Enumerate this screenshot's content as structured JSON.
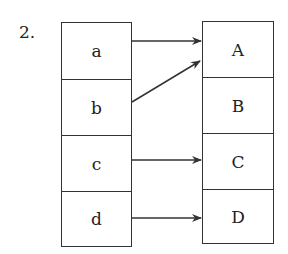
{
  "problem_number": "2.",
  "left_column": {
    "items": [
      "a",
      "b",
      "c",
      "d"
    ]
  },
  "right_column": {
    "items": [
      "A",
      "B",
      "C",
      "D"
    ]
  },
  "mappings": [
    {
      "from": "a",
      "to": "A"
    },
    {
      "from": "b",
      "to": "A"
    },
    {
      "from": "c",
      "to": "C"
    },
    {
      "from": "d",
      "to": "D"
    }
  ]
}
